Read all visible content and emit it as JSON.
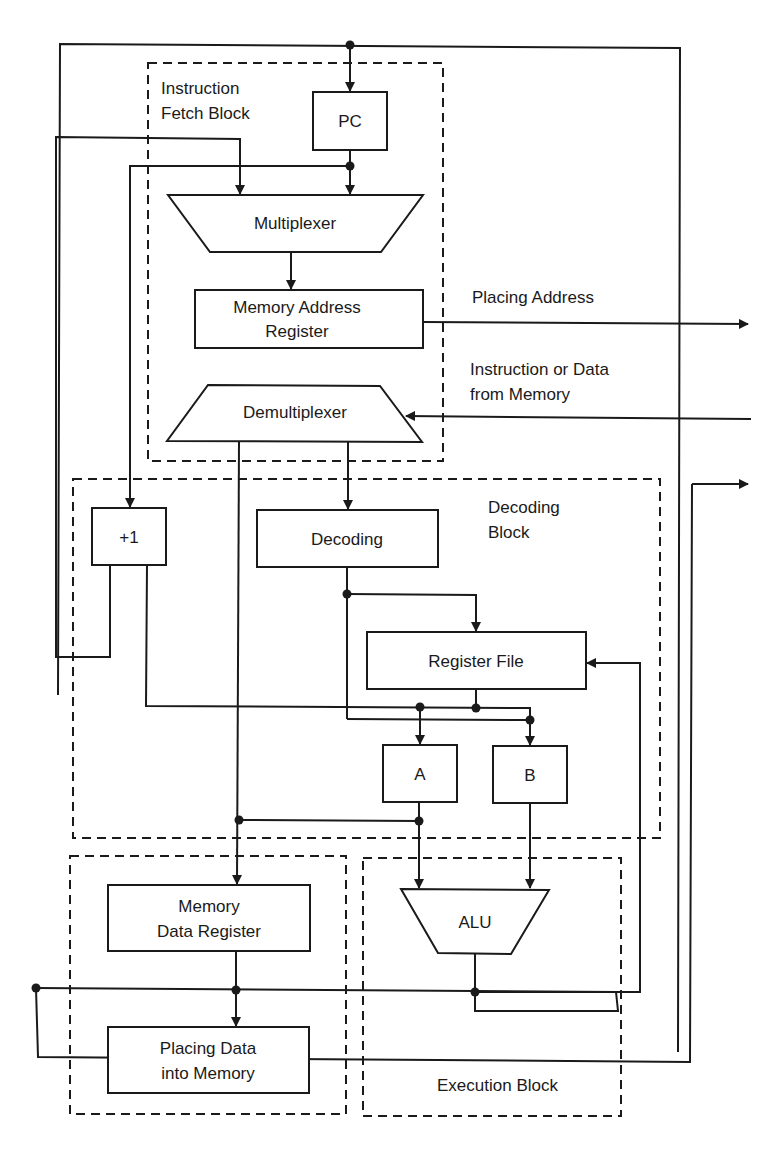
{
  "diagram": {
    "blocks": {
      "fetch": {
        "label_line1": "Instruction",
        "label_line2": "Fetch Block"
      },
      "decode": {
        "label_line1": "Decoding",
        "label_line2": "Block"
      },
      "execute": {
        "label": "Execution Block"
      }
    },
    "components": {
      "pc": "PC",
      "mux": "Multiplexer",
      "mar_line1": "Memory Address",
      "mar_line2": "Register",
      "demux": "Demultiplexer",
      "inc": "+1",
      "decoding": "Decoding",
      "regfile": "Register File",
      "reg_a": "A",
      "reg_b": "B",
      "alu": "ALU",
      "mdr_line1": "Memory",
      "mdr_line2": "Data Register",
      "store_line1": "Placing Data",
      "store_line2": "into Memory"
    },
    "external": {
      "address_out": "Placing Address",
      "mem_in_line1": "Instruction or Data",
      "mem_in_line2": "from Memory"
    },
    "colors": {
      "stroke": "#1a1a1a",
      "background": "#ffffff"
    }
  }
}
